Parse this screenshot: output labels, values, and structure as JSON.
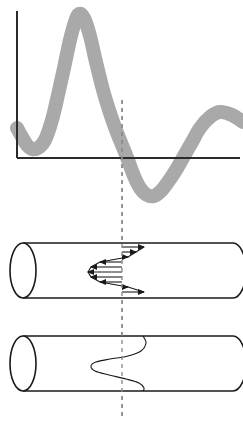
{
  "figure": {
    "title": "",
    "background_color": "#ffffff",
    "width": 243,
    "height": 434,
    "panels": [
      {
        "id": "velocity-waveform-plot",
        "label": ""
      },
      {
        "id": "pipe-with-velocity-vectors",
        "label": ""
      },
      {
        "id": "pipe-with-velocity-envelope",
        "label": ""
      }
    ]
  },
  "colors": {
    "band_gray": "#a9a9a9",
    "axis_black": "#2b2b2b",
    "outline_black": "#1a1a1a",
    "dashed_gray": "#8d8d8d",
    "white": "#ffffff"
  },
  "chart_data": {
    "type": "line",
    "title": "",
    "xlabel": "",
    "ylabel": "",
    "grid": false,
    "legend": null,
    "axis": {
      "y_axis_x": 17,
      "y_axis_top": 11,
      "y_axis_bottom": 158,
      "x_axis_y": 158,
      "x_axis_left": 17,
      "x_axis_right": 240
    },
    "xlim": [
      0,
      243
    ],
    "ylim": [
      220,
      0
    ],
    "band_half_width": 7,
    "series": [
      {
        "name": "flow-waveform-band",
        "style": "thick-gray-band",
        "color": "#a9a9a9",
        "x": [
          17,
          22,
          27,
          32,
          38,
          45,
          52,
          58,
          64,
          70,
          75,
          79,
          84,
          90,
          96,
          103,
          110,
          116,
          122,
          128,
          134,
          140,
          147,
          154,
          161,
          168,
          176,
          184,
          192,
          200,
          210,
          220,
          232,
          243
        ],
        "y": [
          128,
          137,
          145,
          149,
          148,
          140,
          120,
          95,
          68,
          40,
          22,
          14,
          18,
          36,
          62,
          90,
          113,
          130,
          145,
          160,
          176,
          188,
          195,
          196,
          191,
          182,
          170,
          156,
          142,
          128,
          117,
          112,
          115,
          122
        ]
      }
    ],
    "annotations": [
      {
        "name": "systole-marker-dashed-line",
        "type": "vertical-dashed-line",
        "x": 122,
        "y_start": 100,
        "y_end": 420,
        "color": "#8d8d8d"
      }
    ]
  },
  "pipe_vectors": {
    "name": "pipe-with-velocity-vectors",
    "pipe": {
      "left_cap_center_x": 23,
      "top_y": 243,
      "bottom_y": 298,
      "right_x": 233,
      "cap_rx": 13,
      "cap_ry": 27.5
    },
    "centerline_x": 122,
    "description": "Velocity vector profile across pipe cross-section at systole marker",
    "vectors": [
      {
        "index": 0,
        "y": 247,
        "length": 22,
        "direction": "right"
      },
      {
        "index": 1,
        "y": 252,
        "length": 14,
        "direction": "right"
      },
      {
        "index": 2,
        "y": 257,
        "length": 6,
        "direction": "right"
      },
      {
        "index": 3,
        "y": 262,
        "length": 22,
        "direction": "left"
      },
      {
        "index": 4,
        "y": 267,
        "length": 31,
        "direction": "left"
      },
      {
        "index": 5,
        "y": 272,
        "length": 34,
        "direction": "left"
      },
      {
        "index": 6,
        "y": 277,
        "length": 31,
        "direction": "left"
      },
      {
        "index": 7,
        "y": 282,
        "length": 22,
        "direction": "left"
      },
      {
        "index": 8,
        "y": 287,
        "length": 6,
        "direction": "right"
      },
      {
        "index": 9,
        "y": 292,
        "length": 22,
        "direction": "right"
      }
    ]
  },
  "pipe_envelope": {
    "name": "pipe-with-velocity-envelope",
    "pipe": {
      "left_cap_center_x": 23,
      "top_y": 336,
      "bottom_y": 391,
      "right_x": 233,
      "cap_rx": 13,
      "cap_ry": 27.5
    },
    "centerline_x": 122,
    "description": "S-shaped velocity profile envelope curve across pipe cross-section",
    "curve_points": [
      {
        "x": 143,
        "y": 336
      },
      {
        "x": 146,
        "y": 343
      },
      {
        "x": 141,
        "y": 351
      },
      {
        "x": 128,
        "y": 356
      },
      {
        "x": 110,
        "y": 359
      },
      {
        "x": 96,
        "y": 362
      },
      {
        "x": 91,
        "y": 366
      },
      {
        "x": 95,
        "y": 371
      },
      {
        "x": 109,
        "y": 375
      },
      {
        "x": 126,
        "y": 379
      },
      {
        "x": 139,
        "y": 383
      },
      {
        "x": 144,
        "y": 388
      },
      {
        "x": 143,
        "y": 391
      }
    ]
  }
}
